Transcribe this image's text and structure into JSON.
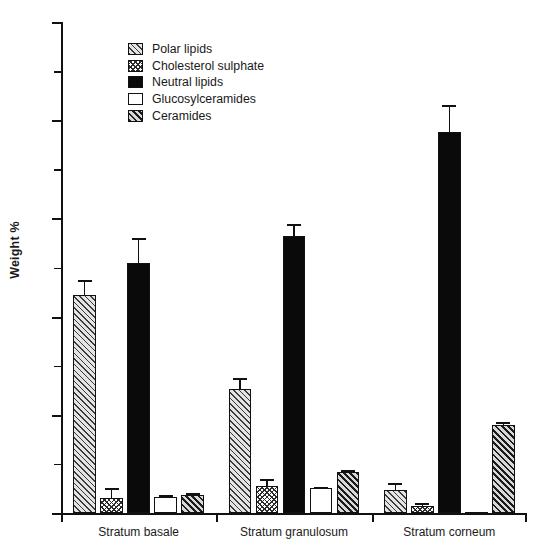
{
  "chart_data": {
    "type": "bar",
    "title": "",
    "xlabel": "",
    "ylabel": "Weight %",
    "ylim": [
      0,
      100
    ],
    "ytick_values": [
      0,
      20,
      40,
      60,
      80,
      100
    ],
    "ytick_labels": [
      "0",
      "20",
      "40",
      "60",
      "80",
      "100"
    ],
    "yminor_values": [
      10,
      30,
      50,
      70,
      90
    ],
    "grid": false,
    "legend_position": "upper-left-inside",
    "categories": [
      "Stratum basale",
      "Stratum granulosum",
      "Stratum corneum"
    ],
    "series": [
      {
        "name": "Polar lipids",
        "swatch": "light-grey-diagonal-hatch",
        "values": [
          44.5,
          25.2,
          4.7
        ],
        "errors": [
          3.0,
          2.2,
          1.4
        ]
      },
      {
        "name": "Cholesterol sulphate",
        "swatch": "white-crosshatch",
        "values": [
          3.0,
          5.5,
          1.5
        ],
        "errors": [
          2.1,
          1.4,
          0.5
        ]
      },
      {
        "name": "Neutral lipids",
        "swatch": "solid-black",
        "values": [
          51.0,
          56.5,
          77.5
        ],
        "errors": [
          5.0,
          2.4,
          5.6
        ]
      },
      {
        "name": "Glucosylceramides",
        "swatch": "white-solid",
        "values": [
          3.3,
          5.0,
          0.2
        ],
        "errors": [
          0.3,
          0.3,
          0.0
        ]
      },
      {
        "name": "Ceramides",
        "swatch": "dark-grey-diagonal-hatch",
        "values": [
          3.6,
          8.3,
          18.0
        ],
        "errors": [
          0.4,
          0.5,
          0.5
        ]
      }
    ]
  },
  "axis": {
    "ylabel": "Weight %",
    "ytick_0": "0",
    "ytick_20": "20",
    "ytick_40": "40",
    "ytick_60": "60",
    "ytick_80": "80",
    "ytick_100": "100"
  },
  "legend": {
    "items": [
      {
        "label": "Polar lipids"
      },
      {
        "label": "Cholesterol sulphate"
      },
      {
        "label": "Neutral lipids"
      },
      {
        "label": "Glucosylceramides"
      },
      {
        "label": "Ceramides"
      }
    ]
  },
  "categories": [
    {
      "label": "Stratum basale"
    },
    {
      "label": "Stratum granulosum"
    },
    {
      "label": "Stratum corneum"
    }
  ]
}
